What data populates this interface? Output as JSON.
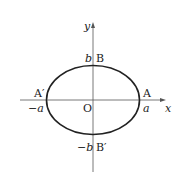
{
  "diagram": {
    "type": "ellipse-on-axes",
    "axes": {
      "x_label": "x",
      "y_label": "y",
      "origin_label": "O"
    },
    "points": {
      "A": {
        "label": "A",
        "value": "a"
      },
      "A_prime": {
        "label": "A′",
        "value": "−a"
      },
      "B": {
        "label": "B",
        "value": "b"
      },
      "B_prime": {
        "label": "B′",
        "value": "−b"
      }
    },
    "colors": {
      "stroke": "#222222",
      "axis": "#555555",
      "background": "#ffffff"
    }
  }
}
